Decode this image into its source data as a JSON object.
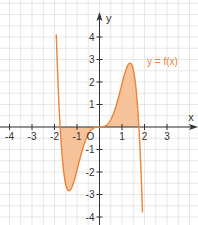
{
  "chart_data": {
    "type": "line",
    "title": "",
    "xlabel": "x",
    "ylabel": "y",
    "xlim": [
      -4.4,
      4.4
    ],
    "ylim": [
      -4.3,
      5.1
    ],
    "grid": true,
    "grid_step": 0.5,
    "x_ticks": [
      -4,
      -3,
      -2,
      -1,
      0,
      1,
      2,
      3
    ],
    "x_tick_labels": [
      "-4",
      "-3",
      "-2",
      "-1",
      "0",
      "1",
      "2",
      "3"
    ],
    "y_ticks": [
      -4,
      -3,
      -2,
      -1,
      1,
      2,
      3,
      4
    ],
    "y_tick_labels": [
      "-4",
      "-3",
      "-2",
      "-1",
      "1",
      "2",
      "3",
      "4"
    ],
    "series": [
      {
        "name": "y = f(x)",
        "color": "#e9833a",
        "x": [
          -1.9,
          -1.8,
          -1.75,
          -1.7,
          -1.6,
          -1.5,
          -1.4,
          -1.35,
          -1.3,
          -1.2,
          -1.1,
          -1.0,
          -0.8,
          -0.6,
          -0.4,
          -0.2,
          0,
          0.2,
          0.4,
          0.6,
          0.8,
          1.0,
          1.1,
          1.2,
          1.3,
          1.35,
          1.4,
          1.5,
          1.6,
          1.7,
          1.75,
          1.8,
          1.9
        ],
        "y": [
          -3.7,
          -0.97,
          0,
          0.77,
          1.94,
          2.56,
          2.83,
          2.85,
          2.8,
          2.49,
          2.02,
          1.92,
          1.21,
          0.57,
          0.17,
          0.02,
          0,
          -0.02,
          -0.17,
          -0.57,
          -1.21,
          -1.92,
          -2.02,
          -2.49,
          -2.8,
          -2.85,
          -2.83,
          -2.56,
          -1.94,
          -0.77,
          0,
          0.97,
          3.7
        ]
      }
    ],
    "shaded_regions": [
      {
        "from_x": -1.75,
        "to_x": 0,
        "between": "curve and x-axis",
        "color": "#f6b98a"
      },
      {
        "from_x": 0,
        "to_x": 1.75,
        "between": "curve and x-axis",
        "color": "#f6b98a"
      }
    ],
    "annotations": [
      {
        "text": "y = f(x)",
        "x": 2.15,
        "y": 2.9,
        "color": "#e9833a"
      },
      {
        "text": "O",
        "x": -0.15,
        "y": -0.25
      }
    ],
    "function_params": {
      "k": 0.93,
      "root": 1.75
    }
  },
  "labels": {
    "x_axis": "x",
    "y_axis": "y",
    "origin": "O",
    "function": "y = f(x)"
  }
}
